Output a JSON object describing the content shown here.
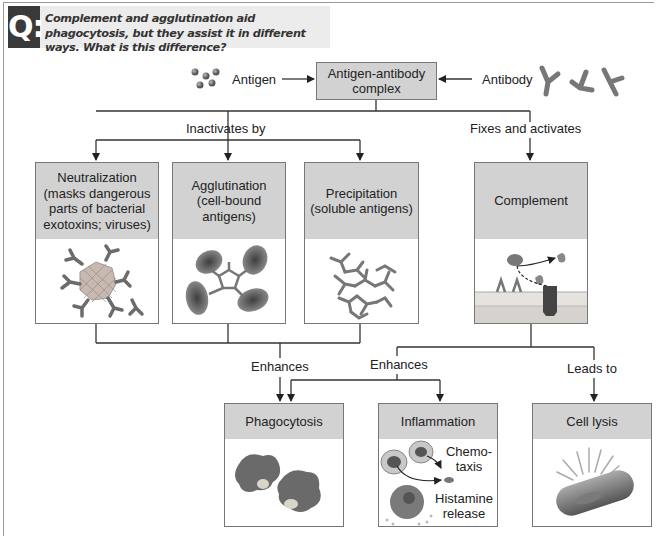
{
  "question": {
    "badge": "Q:",
    "text": "Complement and agglutination aid phagocytosis, but they assist it in different ways. What is this difference?"
  },
  "inputs": {
    "antigen_label": "Antigen",
    "antibody_label": "Antibody",
    "complex_label": "Antigen-antibody complex"
  },
  "edges": {
    "inactivates_by": "Inactivates by",
    "fixes_and_activates": "Fixes and activates",
    "enhances_1": "Enhances",
    "enhances_2": "Enhances",
    "leads_to": "Leads to"
  },
  "mechanisms": [
    {
      "title": "Neutralization (masks dangerous parts of bacterial exotoxins; viruses)",
      "icon": "virus-antibody-icon"
    },
    {
      "title": "Agglutination (cell-bound antigens)",
      "icon": "agglutinated-cells-icon"
    },
    {
      "title": "Precipitation (soluble antigens)",
      "icon": "antibody-lattice-icon"
    },
    {
      "title": "Complement",
      "icon": "complement-membrane-icon"
    }
  ],
  "outcomes": [
    {
      "title": "Phagocytosis",
      "icon": "phagocyte-icon"
    },
    {
      "title": "Inflammation",
      "icon": "inflammation-icon",
      "annotations": [
        "Chemo-taxis",
        "Histamine release"
      ]
    },
    {
      "title": "Cell lysis",
      "icon": "lysed-cell-icon"
    }
  ],
  "colors": {
    "box_header": "#d2d2d2",
    "box_border": "#777777",
    "line": "#333333",
    "q_badge": "#3a3a3a",
    "q_bar": "#ececec"
  }
}
